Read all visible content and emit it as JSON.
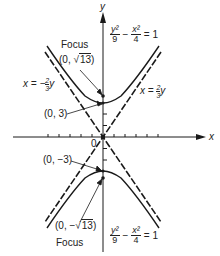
{
  "diagram": {
    "type": "hyperbola",
    "equation": {
      "lhs_num1": "y²",
      "lhs_den1": "9",
      "minus": "−",
      "lhs_num2": "x²",
      "lhs_den2": "4",
      "equals": "= 1"
    },
    "axes": {
      "x_label": "x",
      "y_label": "y",
      "origin_label": "0"
    },
    "asymptotes": [
      {
        "prefix": "x = −",
        "num": "2",
        "den": "3",
        "var": "y"
      },
      {
        "prefix": "x = ",
        "num": "2",
        "den": "3",
        "var": "y"
      }
    ],
    "points": {
      "focus_top_label": "Focus",
      "focus_top_coord_prefix": "(0, ",
      "focus_top_coord_root": "13",
      "focus_top_coord_suffix": ")",
      "vertex_top": "(0, 3)",
      "vertex_bottom": "(0, −3)",
      "focus_bottom_coord_prefix": "(0, −",
      "focus_bottom_coord_root": "13",
      "focus_bottom_coord_suffix": ")",
      "focus_bottom_label": "Focus"
    },
    "colors": {
      "ink": "#1a1a1a",
      "background": "#ffffff"
    }
  }
}
